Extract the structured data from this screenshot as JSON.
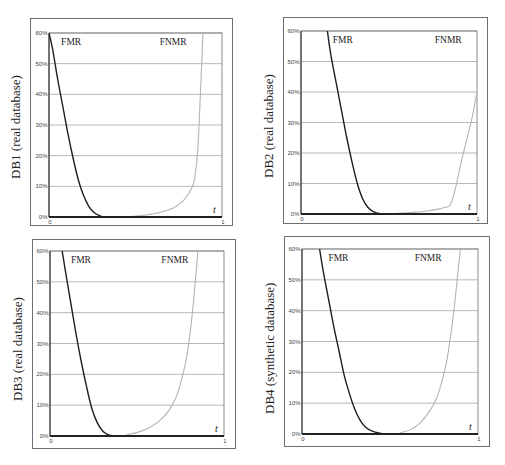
{
  "figure": {
    "width": 505,
    "height": 465,
    "colors": {
      "fmr": "#1e1e1e",
      "fnmr": "#b4b4b4",
      "grid": "#9a9a9a",
      "axis": "#222222",
      "frame": "#6e6e6e"
    }
  },
  "chart_data": [
    {
      "type": "line",
      "id": "db1",
      "title": "",
      "ylabel": "DB1 (real database)",
      "xlabel": "t",
      "xlim": [
        0,
        1
      ],
      "ylim": [
        0,
        60
      ],
      "x_ticks": [
        "0",
        "1"
      ],
      "y_ticks": [
        "0%",
        "10%",
        "20%",
        "30%",
        "40%",
        "50%",
        "60%"
      ],
      "grid": true,
      "legend": "inline labels",
      "series_labels": {
        "fmr": "FMR",
        "fnmr": "FNMR"
      },
      "layout": {
        "box": [
          30,
          18,
          203,
          208
        ],
        "plot": [
          49,
          33,
          222,
          217
        ]
      },
      "series": [
        {
          "name": "FMR",
          "x": [
            0,
            0.02,
            0.05,
            0.08,
            0.11,
            0.14,
            0.17,
            0.2,
            0.23,
            0.26,
            0.29,
            0.32,
            0.4,
            1.0
          ],
          "values": [
            60,
            55,
            45,
            36,
            27,
            19,
            12,
            7,
            3.5,
            1.5,
            0.5,
            0,
            0,
            0
          ]
        },
        {
          "name": "FNMR",
          "x": [
            0,
            0.4,
            0.5,
            0.58,
            0.66,
            0.72,
            0.77,
            0.8,
            0.82,
            0.84,
            0.86,
            0.875,
            0.89
          ],
          "values": [
            0,
            0,
            0.3,
            0.8,
            1.8,
            3,
            5,
            7,
            9,
            12,
            22,
            40,
            60
          ]
        }
      ]
    },
    {
      "type": "line",
      "id": "db2",
      "title": "",
      "ylabel": "DB2 (real database)",
      "xlabel": "t",
      "xlim": [
        0,
        1
      ],
      "ylim": [
        0,
        60
      ],
      "x_ticks": [
        "0",
        "1"
      ],
      "y_ticks": [
        "0%",
        "10%",
        "20%",
        "30%",
        "40%",
        "50%",
        "60%"
      ],
      "grid": true,
      "legend": "inline labels",
      "series_labels": {
        "fmr": "FMR",
        "fnmr": "FNMR"
      },
      "layout": {
        "box": [
          283,
          17,
          205,
          207
        ],
        "plot": [
          301,
          31,
          477,
          214
        ]
      },
      "series": [
        {
          "name": "FMR",
          "x": [
            0.15,
            0.17,
            0.2,
            0.23,
            0.26,
            0.29,
            0.32,
            0.35,
            0.38,
            0.41,
            0.45,
            0.5,
            1.0
          ],
          "values": [
            60,
            52,
            43,
            34,
            25,
            17,
            10,
            5,
            2.2,
            0.8,
            0.1,
            0,
            0
          ]
        },
        {
          "name": "FNMR",
          "x": [
            0,
            0.45,
            0.55,
            0.65,
            0.72,
            0.78,
            0.82,
            0.85,
            0.88,
            0.91,
            0.94,
            0.97,
            1.0
          ],
          "values": [
            0,
            0,
            0.2,
            0.6,
            1.0,
            1.6,
            2.2,
            3.2,
            9,
            17,
            24,
            31,
            40
          ]
        }
      ]
    },
    {
      "type": "line",
      "id": "db3",
      "title": "",
      "ylabel": "DB3 (real database)",
      "xlabel": "t",
      "xlim": [
        0,
        1
      ],
      "ylim": [
        0,
        60
      ],
      "x_ticks": [
        "0",
        "1"
      ],
      "y_ticks": [
        "0%",
        "10%",
        "20%",
        "30%",
        "40%",
        "50%",
        "60%"
      ],
      "grid": true,
      "legend": "inline labels",
      "series_labels": {
        "fmr": "FMR",
        "fnmr": "FNMR"
      },
      "layout": {
        "box": [
          32,
          239,
          204,
          210
        ],
        "plot": [
          50,
          251,
          224,
          436
        ]
      },
      "series": [
        {
          "name": "FMR",
          "x": [
            0.07,
            0.09,
            0.12,
            0.15,
            0.18,
            0.21,
            0.24,
            0.27,
            0.3,
            0.33,
            0.36,
            0.4,
            1.0
          ],
          "values": [
            60,
            53,
            43,
            33,
            24,
            16,
            9,
            4.5,
            1.8,
            0.5,
            0.1,
            0,
            0
          ]
        },
        {
          "name": "FNMR",
          "x": [
            0,
            0.38,
            0.45,
            0.52,
            0.58,
            0.63,
            0.68,
            0.72,
            0.75,
            0.78,
            0.8,
            0.82,
            0.835,
            0.85
          ],
          "values": [
            0,
            0,
            0.5,
            1.5,
            3,
            5,
            8,
            12,
            17,
            24,
            31,
            41,
            50,
            60
          ]
        }
      ]
    },
    {
      "type": "line",
      "id": "db4",
      "title": "",
      "ylabel": "DB4 (synthetic database)",
      "xlabel": "t",
      "xlim": [
        0,
        1
      ],
      "ylim": [
        0,
        60
      ],
      "x_ticks": [
        "0",
        "1"
      ],
      "y_ticks": [
        "0%",
        "10%",
        "20%",
        "30%",
        "40%",
        "50%",
        "60%"
      ],
      "grid": true,
      "legend": "inline labels",
      "series_labels": {
        "fmr": "FMR",
        "fnmr": "FNMR"
      },
      "layout": {
        "box": [
          284,
          236,
          206,
          211
        ],
        "plot": [
          302,
          249,
          478,
          434
        ]
      },
      "series": [
        {
          "name": "FMR",
          "x": [
            0.1,
            0.12,
            0.15,
            0.18,
            0.21,
            0.24,
            0.27,
            0.3,
            0.33,
            0.36,
            0.4,
            0.44,
            0.48,
            0.55,
            1.0
          ],
          "values": [
            60,
            53,
            44,
            35,
            27,
            19,
            13,
            8,
            4.5,
            2.3,
            0.9,
            0.3,
            0.05,
            0,
            0
          ]
        },
        {
          "name": "FNMR",
          "x": [
            0,
            0.5,
            0.56,
            0.62,
            0.67,
            0.72,
            0.76,
            0.79,
            0.82,
            0.845,
            0.865,
            0.885,
            0.9
          ],
          "values": [
            0,
            0,
            0.4,
            1.5,
            3.5,
            7,
            11,
            16,
            23,
            32,
            41,
            52,
            60
          ]
        }
      ]
    }
  ]
}
